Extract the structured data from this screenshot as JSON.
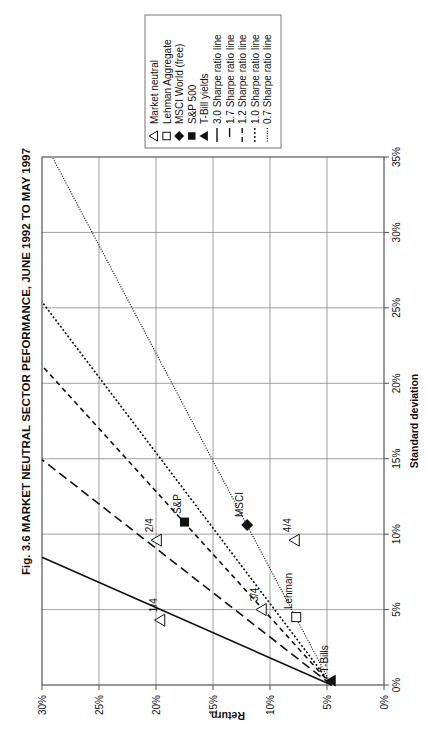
{
  "chart_data": {
    "type": "scatter",
    "title": "Fig. 3.6  MARKET NEUTRAL SECTOR PEFORMANCE, JUNE 1992 TO MAY 1997",
    "xlabel": "Standard deviation",
    "ylabel": "Return",
    "xlim": [
      0,
      35
    ],
    "ylim": [
      0,
      30
    ],
    "x_ticks": [
      "0%",
      "5%",
      "10%",
      "15%",
      "20%",
      "25%",
      "30%",
      "35%"
    ],
    "y_ticks": [
      "0%",
      "5%",
      "10%",
      "15%",
      "20%",
      "25%",
      "30%"
    ],
    "grid": true,
    "legend_position": "top-right (rotated figure)",
    "orientation_note": "Figure printed rotated 90 degrees counter-clockwise",
    "points": [
      {
        "label": "1/4",
        "series": "Market neutral",
        "marker": "open-triangle",
        "std": 4.3,
        "return": 19.6
      },
      {
        "label": "2/4",
        "series": "Market neutral",
        "marker": "open-triangle",
        "std": 9.6,
        "return": 19.9
      },
      {
        "label": "3/4",
        "series": "Market neutral",
        "marker": "open-triangle",
        "std": 5.0,
        "return": 10.7
      },
      {
        "label": "4/4",
        "series": "Market neutral",
        "marker": "open-triangle",
        "std": 9.6,
        "return": 7.8
      },
      {
        "label": "Lehman",
        "series": "Lehman Aggregate",
        "marker": "open-square",
        "std": 4.5,
        "return": 7.7
      },
      {
        "label": "MSCI",
        "series": "MSCI World (free)",
        "marker": "filled-diamond",
        "std": 10.6,
        "return": 12.0
      },
      {
        "label": "S&P",
        "series": "S&P 500",
        "marker": "filled-square",
        "std": 10.8,
        "return": 17.5
      },
      {
        "label": "T-Bills",
        "series": "T-Bill yields",
        "marker": "filled-triangle",
        "std": 0.3,
        "return": 4.6
      }
    ],
    "sharpe_lines": [
      {
        "name": "3.0 Sharpe ratio line",
        "ratio": 3.0,
        "style": "solid",
        "origin": [
          0,
          4.6
        ]
      },
      {
        "name": "1.7 Sharpe ratio line",
        "ratio": 1.7,
        "style": "long-dash",
        "origin": [
          0,
          4.6
        ]
      },
      {
        "name": "1.2 Sharpe ratio line",
        "ratio": 1.2,
        "style": "short-dash",
        "origin": [
          0,
          4.6
        ]
      },
      {
        "name": "1.0 Sharpe ratio line",
        "ratio": 1.0,
        "style": "dotted",
        "origin": [
          0,
          4.6
        ]
      },
      {
        "name": "0.7 Sharpe ratio line",
        "ratio": 0.7,
        "style": "fine-dotted",
        "origin": [
          0,
          4.6
        ]
      }
    ],
    "legend": [
      {
        "marker": "open-triangle",
        "label": "Market neutral"
      },
      {
        "marker": "open-square",
        "label": "Lehman Aggregate"
      },
      {
        "marker": "filled-diamond",
        "label": "MSCI World (free)"
      },
      {
        "marker": "filled-square",
        "label": "S&P 500"
      },
      {
        "marker": "filled-triangle",
        "label": "T-Bill yields"
      },
      {
        "marker": "solid",
        "label": "3.0 Sharpe ratio line"
      },
      {
        "marker": "long-dash",
        "label": "1.7 Sharpe ratio line"
      },
      {
        "marker": "short-dash",
        "label": "1.2 Sharpe ratio line"
      },
      {
        "marker": "dotted",
        "label": "1.0 Sharpe ratio line"
      },
      {
        "marker": "fine-dotted",
        "label": "0.7 Sharpe ratio line"
      }
    ]
  }
}
